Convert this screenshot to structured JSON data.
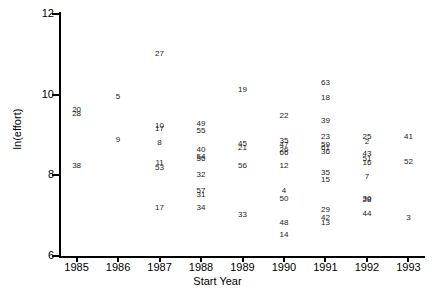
{
  "chart_data": {
    "type": "scatter",
    "title": "",
    "xlabel": "Start Year",
    "ylabel": "ln(effort)",
    "xlim": [
      1984.6,
      1993.4
    ],
    "ylim": [
      6,
      12
    ],
    "xticks": [
      1985,
      1986,
      1987,
      1988,
      1989,
      1990,
      1991,
      1992,
      1993
    ],
    "yticks": [
      6,
      8,
      10,
      12
    ],
    "grid": false,
    "legend": false,
    "point_labels": "study id numbers plotted as text markers",
    "points": [
      {
        "label": "20",
        "x": 1985.0,
        "y": 9.62
      },
      {
        "label": "28",
        "x": 1985.0,
        "y": 9.52
      },
      {
        "label": "38",
        "x": 1985.0,
        "y": 8.22
      },
      {
        "label": "5",
        "x": 1986.0,
        "y": 9.95
      },
      {
        "label": "9",
        "x": 1986.0,
        "y": 8.88
      },
      {
        "label": "27",
        "x": 1987.0,
        "y": 11.02
      },
      {
        "label": "10",
        "x": 1987.0,
        "y": 9.22
      },
      {
        "label": "17",
        "x": 1987.0,
        "y": 9.15
      },
      {
        "label": "8",
        "x": 1987.0,
        "y": 8.8
      },
      {
        "label": "11",
        "x": 1987.0,
        "y": 8.3
      },
      {
        "label": "53",
        "x": 1987.0,
        "y": 8.18
      },
      {
        "label": "17",
        "x": 1987.0,
        "y": 7.18
      },
      {
        "label": "49",
        "x": 1988.0,
        "y": 9.28
      },
      {
        "label": "55",
        "x": 1988.0,
        "y": 9.1
      },
      {
        "label": "40",
        "x": 1988.0,
        "y": 8.62
      },
      {
        "label": "54",
        "x": 1988.0,
        "y": 8.45
      },
      {
        "label": "56",
        "x": 1988.0,
        "y": 8.4
      },
      {
        "label": "32",
        "x": 1988.0,
        "y": 8.02
      },
      {
        "label": "57",
        "x": 1988.0,
        "y": 7.62
      },
      {
        "label": "31",
        "x": 1988.0,
        "y": 7.52
      },
      {
        "label": "34",
        "x": 1988.0,
        "y": 7.18
      },
      {
        "label": "19",
        "x": 1989.0,
        "y": 10.12
      },
      {
        "label": "45",
        "x": 1989.0,
        "y": 8.78
      },
      {
        "label": "21",
        "x": 1989.0,
        "y": 8.68
      },
      {
        "label": "56",
        "x": 1989.0,
        "y": 8.22
      },
      {
        "label": "33",
        "x": 1989.0,
        "y": 7.02
      },
      {
        "label": "22",
        "x": 1990.0,
        "y": 9.48
      },
      {
        "label": "35",
        "x": 1990.0,
        "y": 8.85
      },
      {
        "label": "47",
        "x": 1990.0,
        "y": 8.75
      },
      {
        "label": "26",
        "x": 1990.0,
        "y": 8.62
      },
      {
        "label": "66",
        "x": 1990.0,
        "y": 8.55
      },
      {
        "label": "12",
        "x": 1990.0,
        "y": 8.22
      },
      {
        "label": "4",
        "x": 1990.0,
        "y": 7.62
      },
      {
        "label": "50",
        "x": 1990.0,
        "y": 7.42
      },
      {
        "label": "48",
        "x": 1990.0,
        "y": 6.82
      },
      {
        "label": "14",
        "x": 1990.0,
        "y": 6.52
      },
      {
        "label": "63",
        "x": 1991.0,
        "y": 10.28
      },
      {
        "label": "18",
        "x": 1991.0,
        "y": 9.92
      },
      {
        "label": "39",
        "x": 1991.0,
        "y": 9.35
      },
      {
        "label": "23",
        "x": 1991.0,
        "y": 8.95
      },
      {
        "label": "59",
        "x": 1991.0,
        "y": 8.75
      },
      {
        "label": "61",
        "x": 1991.0,
        "y": 8.68
      },
      {
        "label": "36",
        "x": 1991.0,
        "y": 8.58
      },
      {
        "label": "35",
        "x": 1991.0,
        "y": 8.05
      },
      {
        "label": "15",
        "x": 1991.0,
        "y": 7.88
      },
      {
        "label": "29",
        "x": 1991.0,
        "y": 7.15
      },
      {
        "label": "42",
        "x": 1991.0,
        "y": 6.95
      },
      {
        "label": "13",
        "x": 1991.0,
        "y": 6.82
      },
      {
        "label": "25",
        "x": 1992.0,
        "y": 8.95
      },
      {
        "label": "2",
        "x": 1992.0,
        "y": 8.82
      },
      {
        "label": "43",
        "x": 1992.0,
        "y": 8.52
      },
      {
        "label": "51",
        "x": 1992.0,
        "y": 8.4
      },
      {
        "label": "16",
        "x": 1992.0,
        "y": 8.3
      },
      {
        "label": "7",
        "x": 1992.0,
        "y": 7.95
      },
      {
        "label": "30",
        "x": 1992.0,
        "y": 7.42
      },
      {
        "label": "28",
        "x": 1992.0,
        "y": 7.38
      },
      {
        "label": "44",
        "x": 1992.0,
        "y": 7.05
      },
      {
        "label": "41",
        "x": 1993.0,
        "y": 8.95
      },
      {
        "label": "52",
        "x": 1993.0,
        "y": 8.32
      },
      {
        "label": "3",
        "x": 1993.0,
        "y": 6.95
      }
    ]
  }
}
